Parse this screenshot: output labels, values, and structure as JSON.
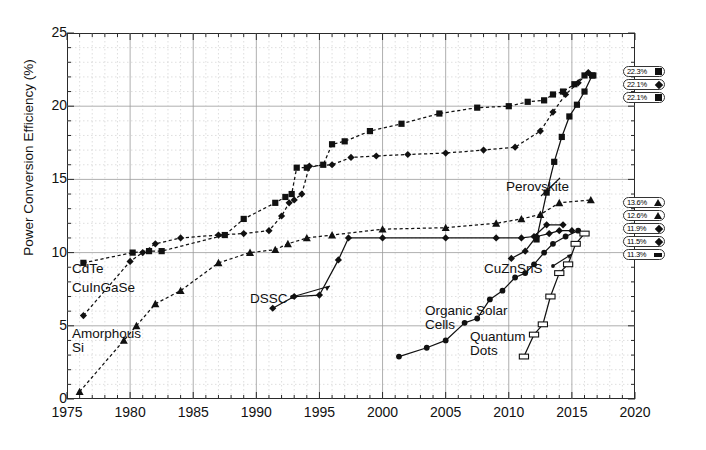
{
  "axes": {
    "ylabel": "Power Conversion Efficiency (%)",
    "yticks": [
      "0",
      "5",
      "10",
      "15",
      "20",
      "25"
    ],
    "xticks": [
      "1975",
      "1980",
      "1985",
      "1990",
      "1995",
      "2000",
      "2005",
      "2010",
      "2015",
      "2020"
    ],
    "xlim": [
      1975,
      2020
    ],
    "ylim": [
      0,
      25
    ]
  },
  "annotations": [
    {
      "name": "cdte",
      "text": "CdTe"
    },
    {
      "name": "cigs",
      "text": "CuInGaSe"
    },
    {
      "name": "amorph",
      "text": "Amorphous"
    },
    {
      "name": "amorph2",
      "text": "Si"
    },
    {
      "name": "dssc",
      "text": "DSSC"
    },
    {
      "name": "perov",
      "text": "Perovskite"
    },
    {
      "name": "czts",
      "text": "CuZnSnS"
    },
    {
      "name": "organic",
      "text": "Organic Solar"
    },
    {
      "name": "organic2",
      "text": "Cells"
    },
    {
      "name": "qd",
      "text": "Quantum"
    },
    {
      "name": "qd2",
      "text": "Dots"
    }
  ],
  "record_labels": [
    {
      "value": "22.3%",
      "marker": "sq",
      "y": 66
    },
    {
      "value": "22.1%",
      "marker": "di",
      "y": 79
    },
    {
      "value": "22.1%",
      "marker": "sq",
      "y": 92
    },
    {
      "value": "13.6%",
      "marker": "tr",
      "y": 197
    },
    {
      "value": "12.6%",
      "marker": "tr",
      "y": 210
    },
    {
      "value": "11.9%",
      "marker": "di",
      "y": 223
    },
    {
      "value": "11.5%",
      "marker": "di",
      "y": 236
    },
    {
      "value": "11.3%",
      "marker": "ba",
      "y": 249
    }
  ],
  "chart_data": {
    "type": "line",
    "title": "",
    "xlabel": "",
    "ylabel": "Power Conversion Efficiency (%)",
    "xlim": [
      1975,
      2020
    ],
    "ylim": [
      0,
      25
    ],
    "grid": true,
    "legend": "right-inline-pills",
    "series": [
      {
        "name": "CdTe",
        "marker": "square",
        "line": "dotted",
        "final_value": 22.1,
        "points": [
          [
            1976.3,
            9.3
          ],
          [
            1980.2,
            10.0
          ],
          [
            1981.5,
            10.1
          ],
          [
            1982.5,
            10.1
          ],
          [
            1987.5,
            11.2
          ],
          [
            1989.0,
            12.3
          ],
          [
            1991.5,
            13.4
          ],
          [
            1992.3,
            13.8
          ],
          [
            1992.8,
            14.0
          ],
          [
            1993.2,
            15.8
          ],
          [
            1994.0,
            15.8
          ],
          [
            1995.3,
            16.0
          ],
          [
            1996.0,
            17.4
          ],
          [
            1997.0,
            17.6
          ],
          [
            1999.0,
            18.3
          ],
          [
            2001.5,
            18.8
          ],
          [
            2004.5,
            19.5
          ],
          [
            2007.5,
            19.9
          ],
          [
            2010.0,
            20.0
          ],
          [
            2011.5,
            20.3
          ],
          [
            2012.8,
            20.4
          ],
          [
            2013.5,
            20.8
          ],
          [
            2014.3,
            21.0
          ],
          [
            2015.2,
            21.5
          ],
          [
            2016.0,
            22.1
          ],
          [
            2016.7,
            22.1
          ]
        ]
      },
      {
        "name": "CuInGaSe",
        "marker": "diamond",
        "line": "dotted",
        "final_value": 22.3,
        "points": [
          [
            1976.3,
            5.7
          ],
          [
            1980.0,
            9.4
          ],
          [
            1981.0,
            10.0
          ],
          [
            1982.0,
            10.6
          ],
          [
            1984.0,
            11.0
          ],
          [
            1987.0,
            11.2
          ],
          [
            1989.0,
            11.3
          ],
          [
            1991.0,
            11.5
          ],
          [
            1992.0,
            12.5
          ],
          [
            1992.6,
            13.4
          ],
          [
            1993.0,
            13.6
          ],
          [
            1993.6,
            14.0
          ],
          [
            1994.2,
            15.9
          ],
          [
            1996.0,
            16.0
          ],
          [
            1997.5,
            16.5
          ],
          [
            1999.5,
            16.6
          ],
          [
            2002.0,
            16.7
          ],
          [
            2005.0,
            16.8
          ],
          [
            2008.0,
            17.0
          ],
          [
            2010.5,
            17.2
          ],
          [
            2012.5,
            18.3
          ],
          [
            2013.5,
            19.6
          ],
          [
            2014.5,
            20.8
          ],
          [
            2015.5,
            21.6
          ],
          [
            2016.3,
            22.3
          ]
        ]
      },
      {
        "name": "Amorphous Si",
        "marker": "triangle",
        "line": "dotted",
        "final_value": 13.6,
        "points": [
          [
            1976.0,
            0.5
          ],
          [
            1979.5,
            4.0
          ],
          [
            1980.5,
            5.0
          ],
          [
            1982.0,
            6.5
          ],
          [
            1984.0,
            7.4
          ],
          [
            1987.0,
            9.3
          ],
          [
            1989.5,
            10.0
          ],
          [
            1991.5,
            10.2
          ],
          [
            1992.5,
            10.6
          ],
          [
            1994.0,
            11.0
          ],
          [
            1996.0,
            11.2
          ],
          [
            2000.0,
            11.6
          ],
          [
            2005.0,
            11.7
          ],
          [
            2009.0,
            12.0
          ],
          [
            2011.0,
            12.3
          ],
          [
            2012.5,
            12.6
          ],
          [
            2014.0,
            13.4
          ],
          [
            2016.5,
            13.6
          ]
        ]
      },
      {
        "name": "DSSC",
        "marker": "diamond",
        "line": "solid",
        "final_value": 11.9,
        "points": [
          [
            1991.3,
            6.2
          ],
          [
            1993.0,
            7.0
          ],
          [
            1995.0,
            7.1
          ],
          [
            1996.5,
            9.5
          ],
          [
            1997.3,
            11.0
          ],
          [
            2000.0,
            11.0
          ],
          [
            2005.0,
            11.0
          ],
          [
            2009.0,
            11.0
          ],
          [
            2011.0,
            11.0
          ],
          [
            2012.0,
            11.1
          ],
          [
            2013.0,
            11.9
          ],
          [
            2014.3,
            11.9
          ]
        ]
      },
      {
        "name": "Perovskite",
        "marker": "square",
        "line": "solid",
        "final_value": 22.1,
        "points": [
          [
            2012.2,
            10.9
          ],
          [
            2013.0,
            14.1
          ],
          [
            2013.6,
            16.2
          ],
          [
            2014.2,
            17.9
          ],
          [
            2014.8,
            19.3
          ],
          [
            2015.4,
            20.1
          ],
          [
            2016.0,
            21.0
          ],
          [
            2016.6,
            22.1
          ]
        ]
      },
      {
        "name": "CuZnSnS",
        "marker": "diamond",
        "line": "solid",
        "final_value": 11.5,
        "points": [
          [
            2010.2,
            9.6
          ],
          [
            2011.3,
            10.1
          ],
          [
            2012.2,
            11.1
          ],
          [
            2013.2,
            11.3
          ],
          [
            2014.0,
            11.5
          ],
          [
            2015.0,
            11.5
          ]
        ]
      },
      {
        "name": "Organic Solar Cells",
        "marker": "circle",
        "line": "solid",
        "final_value": 11.5,
        "points": [
          [
            2001.3,
            2.9
          ],
          [
            2003.5,
            3.5
          ],
          [
            2005.0,
            4.0
          ],
          [
            2006.5,
            5.2
          ],
          [
            2007.5,
            5.5
          ],
          [
            2008.5,
            6.8
          ],
          [
            2009.5,
            7.4
          ],
          [
            2010.5,
            8.3
          ],
          [
            2011.3,
            8.6
          ],
          [
            2012.0,
            9.2
          ],
          [
            2012.8,
            10.0
          ],
          [
            2013.5,
            10.6
          ],
          [
            2014.5,
            11.1
          ],
          [
            2015.5,
            11.5
          ]
        ]
      },
      {
        "name": "Quantum Dots",
        "marker": "bar",
        "line": "solid",
        "final_value": 11.3,
        "points": [
          [
            2011.2,
            2.9
          ],
          [
            2012.0,
            4.4
          ],
          [
            2012.7,
            5.1
          ],
          [
            2013.3,
            7.0
          ],
          [
            2014.0,
            8.6
          ],
          [
            2014.7,
            9.2
          ],
          [
            2015.3,
            10.6
          ],
          [
            2016.0,
            11.3
          ]
        ]
      }
    ]
  }
}
